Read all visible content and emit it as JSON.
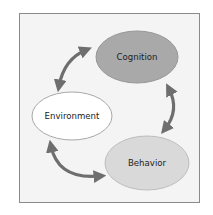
{
  "diagram": {
    "type": "cycle",
    "nodes": [
      {
        "id": "cognition",
        "label": "Cognition",
        "fill": "#a9a9a9",
        "stroke": "#979797"
      },
      {
        "id": "environment",
        "label": "Environment",
        "fill": "#ffffff",
        "stroke": "#a8a8a8"
      },
      {
        "id": "behavior",
        "label": "Behavior",
        "fill": "#d9d9d9",
        "stroke": "#bdbdbd"
      }
    ],
    "edges": [
      {
        "from": "environment",
        "to": "cognition",
        "bidirectional": true
      },
      {
        "from": "cognition",
        "to": "behavior",
        "bidirectional": true
      },
      {
        "from": "behavior",
        "to": "environment",
        "bidirectional": true
      }
    ],
    "colors": {
      "arrow": "#6e6e6e",
      "frame_border": "#8a8a8a",
      "frame_background": "#f4f4f4"
    }
  }
}
